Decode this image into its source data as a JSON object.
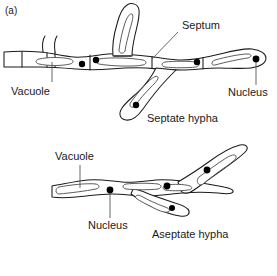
{
  "figure": {
    "panel_label": "(a)",
    "background_color": "#ffffff",
    "ink_color": "#1a1a1a",
    "nucleus_color": "#000000",
    "vacuole_outline_color": "#4a4a4a",
    "leader_color": "#4d4d4d"
  },
  "septate": {
    "caption": "Septate hypha",
    "labels": {
      "vacuole": "Vacuole",
      "septum": "Septum",
      "nucleus": "Nucleus"
    }
  },
  "aseptate": {
    "caption": "Aseptate hypha",
    "labels": {
      "vacuole": "Vacuole",
      "nucleus": "Nucleus"
    }
  }
}
